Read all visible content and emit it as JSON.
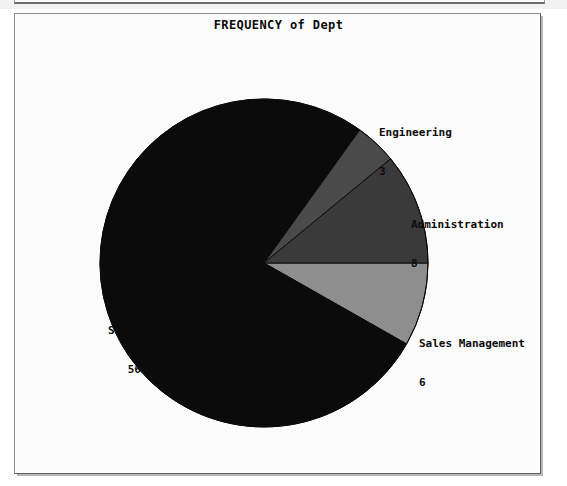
{
  "window": {
    "title": "FREQUENCY of Dept",
    "background_color": "#fbfbfb",
    "border_color": "#8d8d8d"
  },
  "chart_data": {
    "type": "pie",
    "title": "FREQUENCY of Dept",
    "xlabel": "",
    "ylabel": "",
    "total": 73,
    "legend": "none",
    "grid": false,
    "labels_show_value": true,
    "categories": [
      "Sales",
      "Sales Management",
      "Administration",
      "Engineering"
    ],
    "values": [
      56,
      6,
      8,
      3
    ],
    "slices": [
      {
        "label": "Sales",
        "value": 56,
        "value_text": "56",
        "percent": 76.7,
        "angle_deg": 276.2,
        "color": "#0b0b0b",
        "label_align": "right"
      },
      {
        "label": "Sales Management",
        "value": 6,
        "value_text": "6",
        "percent": 8.2,
        "angle_deg": 29.6,
        "color": "#8e8e8e",
        "label_align": "left"
      },
      {
        "label": "Administration",
        "value": 8,
        "value_text": "8",
        "percent": 11.0,
        "angle_deg": 39.5,
        "color": "#3a3a3a",
        "label_align": "left"
      },
      {
        "label": "Engineering",
        "value": 3,
        "value_text": "3",
        "percent": 4.1,
        "angle_deg": 14.8,
        "color": "#4a4a4a",
        "label_align": "left"
      }
    ]
  },
  "labels": {
    "engineering": {
      "name": "Engineering",
      "value": "3"
    },
    "administration": {
      "name": "Administration",
      "value": "8"
    },
    "sales_management": {
      "name": "Sales Management",
      "value": "6"
    },
    "sales": {
      "name": "Sales",
      "value": "56"
    }
  }
}
